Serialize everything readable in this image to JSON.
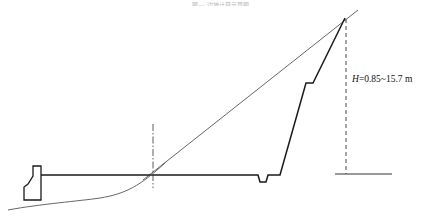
{
  "figure": {
    "caption_faint": "图 — 边坡计算示意图",
    "height_label": {
      "var": "H",
      "text": "=0.85~15.7 m"
    }
  },
  "colors": {
    "line": "#1a1a1a",
    "thin_line": "#555555",
    "background": "#ffffff"
  },
  "geometry": {
    "thin_diagonal": [
      [
        143,
        180
      ],
      [
        358,
        10
      ]
    ],
    "wall_outline": [
      [
        345,
        18
      ],
      [
        313,
        83
      ],
      [
        306,
        83
      ],
      [
        280,
        175
      ],
      [
        268,
        175
      ],
      [
        266,
        182
      ],
      [
        260,
        182
      ],
      [
        258,
        175
      ],
      [
        40,
        175
      ]
    ],
    "dashed_height_line": {
      "x": 346,
      "y1": 18,
      "y2": 174
    },
    "ground_line": {
      "x1": 335,
      "x2": 392,
      "y": 174
    },
    "centerline": {
      "x": 153,
      "y1": 124,
      "y2": 188
    },
    "left_block": [
      [
        33,
        166
      ],
      [
        41,
        166
      ],
      [
        41,
        200
      ],
      [
        24,
        200
      ],
      [
        24,
        187
      ],
      [
        28,
        184
      ],
      [
        33,
        176
      ],
      [
        33,
        166
      ]
    ],
    "curve": "M 8 210 C 40 204, 80 201, 100 198 C 125 194, 140 186, 165 163"
  }
}
